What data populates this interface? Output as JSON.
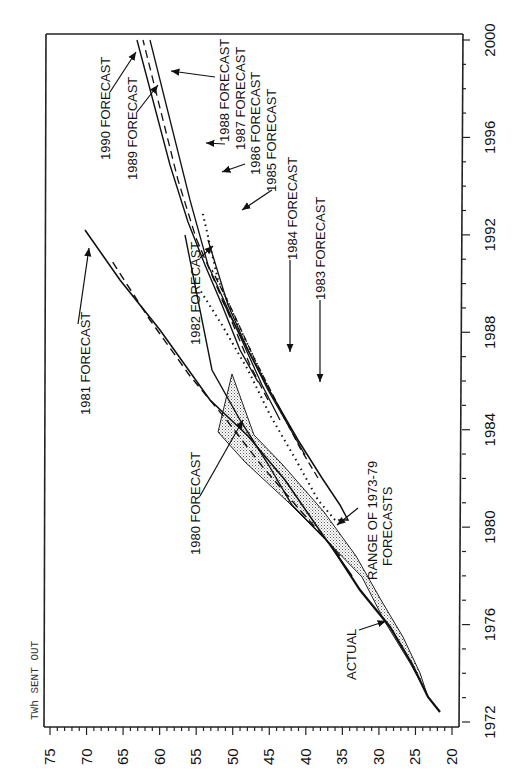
{
  "chart_data": {
    "type": "line",
    "title": "",
    "orientation_note": "rotated 90 degrees: year axis runs vertically on right, TWh axis runs horizontally along bottom (decreasing left to right)",
    "xlabel": "Year",
    "ylabel": "TWh SENT OUT",
    "x_ticks": [
      "1972",
      "1976",
      "1980",
      "1984",
      "1988",
      "1992",
      "1996",
      "2000"
    ],
    "y_ticks": [
      "75",
      "70",
      "65",
      "60",
      "55",
      "50",
      "45",
      "40",
      "35",
      "30",
      "25",
      "20"
    ],
    "xlim": [
      1972,
      2000
    ],
    "ylim": [
      20,
      75
    ],
    "grid": false,
    "legend": "none (inline annotations with arrows)",
    "series": [
      {
        "name": "ACTUAL",
        "style": "solid-bold",
        "points": [
          [
            1972.8,
            22.0
          ],
          [
            1974,
            23.2
          ],
          [
            1976,
            25.5
          ],
          [
            1978,
            28.2
          ],
          [
            1980,
            31.0
          ],
          [
            1982,
            35.5
          ]
        ]
      },
      {
        "name": "RANGE OF 1973-79 FORECASTS",
        "style": "stippled-band",
        "lower": [
          [
            1974,
            23.0
          ],
          [
            1976,
            24.5
          ],
          [
            1978,
            27.0
          ],
          [
            1980,
            30.0
          ],
          [
            1982,
            34.0
          ],
          [
            1984,
            38.5
          ],
          [
            1986,
            43.0
          ],
          [
            1987,
            46.5
          ],
          [
            1988.8,
            50.5
          ]
        ],
        "upper": [
          [
            1974,
            23.5
          ],
          [
            1976,
            26.0
          ],
          [
            1978,
            29.0
          ],
          [
            1980,
            32.5
          ],
          [
            1982,
            36.0
          ],
          [
            1984,
            40.0
          ],
          [
            1986,
            45.0
          ],
          [
            1988,
            49.5
          ],
          [
            1988.8,
            50.5
          ]
        ]
      },
      {
        "name": "1980 FORECAST",
        "style": "solid",
        "points": [
          [
            1980,
            32.0
          ],
          [
            1982,
            36.5
          ],
          [
            1984,
            42.0
          ],
          [
            1986,
            48.5
          ],
          [
            1988,
            55.5
          ],
          [
            1990,
            62.5
          ],
          [
            1991,
            70.0
          ]
        ]
      },
      {
        "name": "1981 FORECAST",
        "style": "dashed",
        "points": [
          [
            1981,
            34.0
          ],
          [
            1983,
            39.0
          ],
          [
            1985,
            46.0
          ],
          [
            1987,
            54.0
          ],
          [
            1989,
            61.5
          ],
          [
            1990.8,
            68.5
          ]
        ]
      },
      {
        "name": "1982 FORECAST",
        "style": "solid",
        "points": [
          [
            1982,
            36.0
          ],
          [
            1984,
            40.5
          ],
          [
            1986,
            44.5
          ],
          [
            1988,
            48.5
          ],
          [
            1990,
            53.0
          ],
          [
            1992,
            56.5
          ]
        ]
      },
      {
        "name": "1983 FORECAST",
        "style": "dotted",
        "points": [
          [
            1983,
            35.0
          ],
          [
            1984,
            36.5
          ],
          [
            1986,
            39.5
          ],
          [
            1988,
            42.5
          ],
          [
            1990,
            45.0
          ],
          [
            1992,
            48.0
          ]
        ]
      },
      {
        "name": "1984 FORECAST",
        "style": "solid",
        "points": [
          [
            1983,
            35.0
          ],
          [
            1984,
            37.0
          ],
          [
            1986,
            40.0
          ],
          [
            1988,
            43.5
          ],
          [
            1990,
            46.5
          ],
          [
            1993,
            50.0
          ]
        ]
      },
      {
        "name": "1985 FORECAST",
        "style": "dashed",
        "points": [
          [
            1985,
            39.0
          ],
          [
            1987,
            41.5
          ],
          [
            1989,
            44.5
          ],
          [
            1991,
            47.0
          ],
          [
            1994,
            50.5
          ]
        ]
      },
      {
        "name": "1986 FORECAST",
        "style": "solid",
        "points": [
          [
            1986,
            41.0
          ],
          [
            1988,
            43.5
          ],
          [
            1990,
            46.5
          ],
          [
            1992,
            49.5
          ],
          [
            1995,
            53.0
          ]
        ]
      },
      {
        "name": "1987 FORECAST",
        "style": "dotted",
        "points": [
          [
            1987,
            43.0
          ],
          [
            1989,
            45.5
          ],
          [
            1991,
            48.5
          ],
          [
            1993,
            51.5
          ],
          [
            1996,
            55.0
          ]
        ]
      },
      {
        "name": "1988 FORECAST",
        "style": "solid",
        "points": [
          [
            1988,
            45.0
          ],
          [
            1990,
            47.5
          ],
          [
            1992,
            50.5
          ],
          [
            1994,
            53.5
          ],
          [
            1996,
            56.5
          ],
          [
            2000,
            61.0
          ]
        ]
      },
      {
        "name": "1989 FORECAST",
        "style": "dashed",
        "points": [
          [
            1989,
            46.5
          ],
          [
            1991,
            49.0
          ],
          [
            1993,
            52.0
          ],
          [
            1995,
            55.0
          ],
          [
            1997,
            58.0
          ],
          [
            2000,
            62.0
          ]
        ]
      },
      {
        "name": "1990 FORECAST",
        "style": "solid",
        "points": [
          [
            1990,
            47.5
          ],
          [
            1992,
            50.0
          ],
          [
            1994,
            53.0
          ],
          [
            1996,
            56.0
          ],
          [
            1998,
            59.5
          ],
          [
            2000,
            63.0
          ]
        ]
      }
    ],
    "annotations": [
      "1990 FORECAST",
      "1989 FORECAST",
      "1988 FORECAST",
      "1987 FORECAST",
      "1986 FORECAST",
      "1985 FORECAST",
      "1984 FORECAST",
      "1983 FORECAST",
      "1982 FORECAST",
      "1981 FORECAST",
      "1980 FORECAST",
      "RANGE OF 1973-79 FORECASTS",
      "ACTUAL"
    ]
  },
  "axis": {
    "ylabel": "TWh SENT OUT",
    "year_ticks": [
      "1972",
      "1976",
      "1980",
      "1984",
      "1988",
      "1992",
      "1996",
      "2000"
    ],
    "twh_ticks": [
      "75",
      "70",
      "65",
      "60",
      "55",
      "50",
      "45",
      "40",
      "35",
      "30",
      "25",
      "20"
    ]
  },
  "labels": {
    "f1990": "1990 FORECAST",
    "f1989": "1989 FORECAST",
    "f1988": "1988 FORECAST",
    "f1987": "1987 FORECAST",
    "f1986": "1986 FORECAST",
    "f1985": "1985 FORECAST",
    "f1984": "1984 FORECAST",
    "f1983": "1983 FORECAST",
    "f1982": "1982 FORECAST",
    "f1981": "1981 FORECAST",
    "f1980": "1980 FORECAST",
    "range1": "RANGE OF 1973-79",
    "range2": "FORECASTS",
    "actual": "ACTUAL"
  }
}
